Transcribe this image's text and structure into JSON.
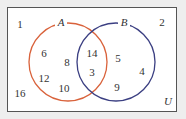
{
  "universe_label": "U",
  "sets": [
    {
      "name": "A",
      "color": "#d9623b"
    },
    {
      "name": "B",
      "color": "#3b3f82"
    }
  ],
  "regions": {
    "outside": [
      "1",
      "16",
      "2"
    ],
    "only_a": [
      "6",
      "8",
      "12",
      "10"
    ],
    "a_and_b": [
      "14",
      "3"
    ],
    "only_b": [
      "5",
      "4",
      "9"
    ]
  }
}
